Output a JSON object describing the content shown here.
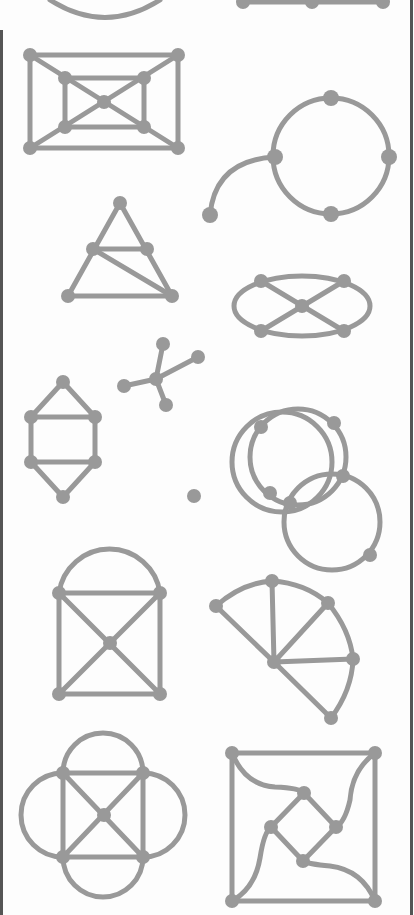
{
  "page": {
    "width": 414,
    "height": 915,
    "background": "#fdfdfd",
    "stroke_color": "#999999",
    "border_color": "#555555"
  },
  "borders": [
    {
      "name": "left-scan-border",
      "x": 0,
      "y": 30,
      "w": 3,
      "h": 885
    },
    {
      "name": "right-scan-border",
      "x": 410,
      "y": 0,
      "w": 3,
      "h": 915
    }
  ],
  "graphs": [
    {
      "name": "partial-circle-graph-top-left",
      "paths": [
        "M 50 0 Q 105 35 160 0"
      ],
      "vertices": []
    },
    {
      "name": "partial-path-graph-top-right",
      "paths": [
        "M 243 2 L 383 2"
      ],
      "vertices": [
        [
          243,
          2,
          7
        ],
        [
          312,
          2,
          7
        ],
        [
          383,
          2,
          7
        ]
      ]
    },
    {
      "name": "nested-rectangles-graph",
      "paths": [
        "M 30 55 L 178 55 L 178 148 L 30 148 Z",
        "M 65 78 L 144 78 L 144 127 L 65 127 Z",
        "M 30 55 L 178 148",
        "M 178 55 L 30 148"
      ],
      "vertices": [
        [
          30,
          55,
          7
        ],
        [
          178,
          55,
          7
        ],
        [
          30,
          148,
          7
        ],
        [
          178,
          148,
          7
        ],
        [
          65,
          78,
          7
        ],
        [
          144,
          78,
          7
        ],
        [
          65,
          127,
          7
        ],
        [
          144,
          127,
          7
        ],
        [
          104,
          102,
          7
        ]
      ]
    },
    {
      "name": "circle-with-tail-graph",
      "paths": [
        "M 331 98 A 58 58 0 1 1 331 214 A 58 58 0 1 1 331 98 Z",
        "M 275 157 Q 215 160 210 215"
      ],
      "vertices": [
        [
          331,
          98,
          8
        ],
        [
          389,
          157,
          8
        ],
        [
          331,
          214,
          8
        ],
        [
          275,
          157,
          8
        ],
        [
          210,
          215,
          8
        ]
      ]
    },
    {
      "name": "subdivided-triangle-graph",
      "paths": [
        "M 120 203 L 68 296 L 172 296 Z",
        "M 93 249 L 147 249",
        "M 93 249 L 172 296"
      ],
      "vertices": [
        [
          120,
          203,
          7
        ],
        [
          93,
          249,
          7
        ],
        [
          147,
          249,
          7
        ],
        [
          68,
          296,
          7
        ],
        [
          172,
          296,
          7
        ]
      ]
    },
    {
      "name": "ellipse-cross-graph",
      "paths": [
        "M 234 306 A 68 30 0 1 0 370 306 A 68 30 0 1 0 234 306 Z",
        "M 261 281 L 344 331",
        "M 344 281 L 261 331"
      ],
      "vertices": [
        [
          261,
          281,
          7
        ],
        [
          344,
          281,
          7
        ],
        [
          261,
          331,
          7
        ],
        [
          344,
          331,
          7
        ],
        [
          302,
          306,
          7
        ]
      ]
    },
    {
      "name": "star-tree-graph",
      "paths": [
        "M 156 379 L 163 344",
        "M 156 379 L 198 357",
        "M 156 379 L 124 386",
        "M 156 379 L 166 405"
      ],
      "vertices": [
        [
          163,
          344,
          7
        ],
        [
          198,
          357,
          7
        ],
        [
          124,
          386,
          7
        ],
        [
          166,
          405,
          7
        ],
        [
          156,
          379,
          7
        ]
      ]
    },
    {
      "name": "hexagon-with-chords-graph",
      "paths": [
        "M 63 382 L 95 417 L 95 462 L 63 497 L 31 462 L 31 417 Z",
        "M 31 417 L 95 417",
        "M 31 462 L 95 462"
      ],
      "vertices": [
        [
          63,
          382,
          7
        ],
        [
          31,
          417,
          7
        ],
        [
          95,
          417,
          7
        ],
        [
          31,
          462,
          7
        ],
        [
          95,
          462,
          7
        ],
        [
          63,
          497,
          7
        ]
      ]
    },
    {
      "name": "three-interlocking-circles-graph",
      "paths": [
        "M 232 462 A 50 50 0 1 1 332 462 A 50 50 0 1 1 232 462 Z",
        "M 250 457 A 48 48 0 1 1 346 457 A 48 48 0 1 1 250 457 Z",
        "M 284 522 A 48 48 0 1 1 380 522 A 48 48 0 1 1 284 522 Z"
      ],
      "vertices": [
        [
          261,
          427,
          7
        ],
        [
          334,
          423,
          7
        ],
        [
          194,
          496,
          7
        ],
        [
          270,
          493,
          7
        ],
        [
          290,
          503,
          7
        ],
        [
          343,
          476,
          7
        ],
        [
          370,
          555,
          7
        ]
      ]
    },
    {
      "name": "arch-over-crossed-square-graph",
      "paths": [
        "M 59 593 A 51 51 0 0 1 160 593",
        "M 59 593 L 160 593 L 160 694 L 59 694 Z",
        "M 59 593 L 160 694",
        "M 160 593 L 59 694"
      ],
      "vertices": [
        [
          59,
          593,
          7
        ],
        [
          160,
          593,
          7
        ],
        [
          59,
          694,
          7
        ],
        [
          160,
          694,
          7
        ],
        [
          110,
          643,
          7
        ]
      ]
    },
    {
      "name": "fan-sector-graph",
      "paths": [
        "M 216 606 Q 242 583 272 581 Q 305 583 328 603 Q 350 630 353 659 Q 352 690 331 718",
        "M 274 662 L 216 606",
        "M 274 662 L 272 581",
        "M 274 662 L 328 603",
        "M 274 662 L 353 659",
        "M 274 662 L 331 718"
      ],
      "vertices": [
        [
          216,
          606,
          7
        ],
        [
          272,
          581,
          7
        ],
        [
          328,
          603,
          7
        ],
        [
          353,
          659,
          7
        ],
        [
          331,
          718,
          7
        ],
        [
          274,
          662,
          7
        ]
      ]
    },
    {
      "name": "four-petal-square-graph",
      "paths": [
        "M 63 773 L 143 773 L 143 857 L 63 857 Z",
        "M 63 773 L 143 857",
        "M 143 773 L 63 857",
        "M 63 773 A 40 40 0 0 1 143 773",
        "M 143 773 A 42 42 0 0 1 143 857",
        "M 143 857 A 40 40 0 0 1 63 857",
        "M 63 857 A 42 42 0 0 1 63 773"
      ],
      "vertices": [
        [
          63,
          773,
          7
        ],
        [
          143,
          773,
          7
        ],
        [
          63,
          857,
          7
        ],
        [
          143,
          857,
          7
        ],
        [
          104,
          815,
          7
        ]
      ]
    },
    {
      "name": "square-with-inner-diamond-graph",
      "paths": [
        "M 232 753 L 375 753 L 375 901 L 232 901 Z",
        "M 304 793 L 336 827 L 303 861 L 271 827 Z",
        "M 232 753 Q 245 785 275 787 Q 300 788 304 793",
        "M 375 753 Q 352 770 350 800 Q 345 822 336 827",
        "M 375 901 Q 362 870 330 866 Q 308 864 303 861",
        "M 232 901 Q 255 888 260 858 Q 264 832 271 827"
      ],
      "vertices": [
        [
          232,
          753,
          7
        ],
        [
          375,
          753,
          7
        ],
        [
          232,
          901,
          7
        ],
        [
          375,
          901,
          7
        ],
        [
          304,
          793,
          7
        ],
        [
          336,
          827,
          7
        ],
        [
          303,
          861,
          7
        ],
        [
          271,
          827,
          7
        ]
      ]
    }
  ]
}
